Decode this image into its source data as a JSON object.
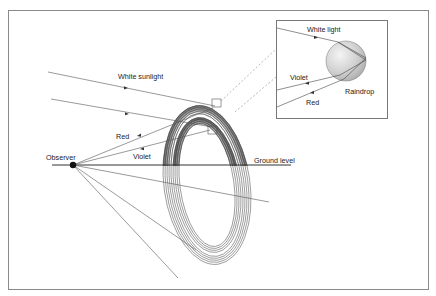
{
  "diagram": {
    "labels": {
      "white_sunlight": "White sunlight",
      "red": "Red",
      "violet": "Violet",
      "observer": "Observer",
      "ground_level": "Ground level"
    },
    "inset": {
      "white_light": "White light",
      "violet": "Violet",
      "red": "Red",
      "raindrop": "Raindrop"
    },
    "colors": {
      "frame": "#8a8a8a",
      "line": "#555555",
      "band_dark": "#6e6e6e",
      "band_mid": "#9a9a9a",
      "band_light": "#c4c4c4",
      "drop_fill": "#d0d0d0",
      "observer_dot": "#111111"
    }
  }
}
